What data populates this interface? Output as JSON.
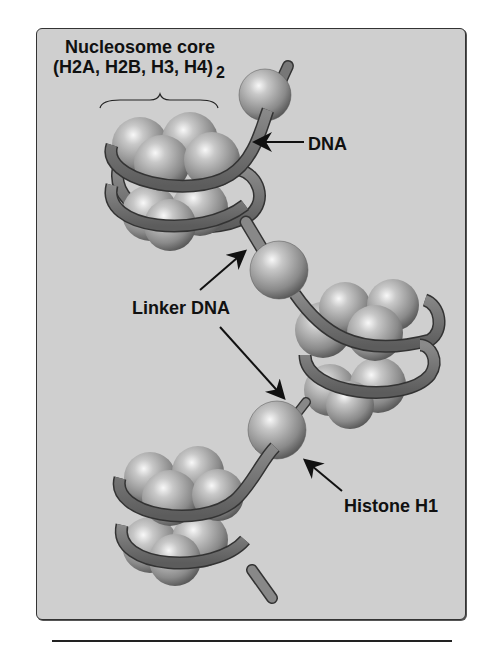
{
  "figure": {
    "title_line1": "Nucleosome core",
    "title_line2": "(H2A, H2B, H3, H4)",
    "title_subscript": "2",
    "labels": {
      "dna": "DNA",
      "linker_dna": "Linker DNA",
      "histone_h1": "Histone H1"
    },
    "colors": {
      "panel_background": "#cfcfcf",
      "dna_ribbon": "#6e6e6e",
      "histone_sphere": "#b8b8b8",
      "text": "#111111"
    }
  }
}
